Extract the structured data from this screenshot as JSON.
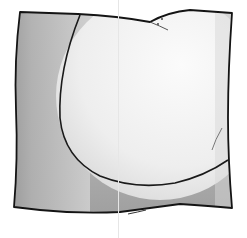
{
  "image": {
    "subject": "square pillow illustration",
    "description": "Sketch-style drawing of a square cushion with a large circular light panel on the front and shaded gray edges",
    "colors": {
      "outline": "#1a1a1a",
      "shadow": "#a8a8a8",
      "mid": "#c8c8c8",
      "highlight": "#f4f4f4",
      "background": "#ffffff"
    }
  }
}
